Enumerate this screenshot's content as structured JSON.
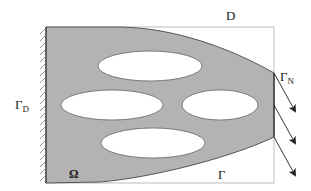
{
  "diagram": {
    "colors": {
      "material_fill": "#b3b3b3",
      "material_edge": "#555555",
      "box_stroke": "#bdbdbd",
      "hatch": "#777777",
      "arrow": "#222222",
      "hole_fill": "#ffffff"
    },
    "labels": {
      "design_domain": "D",
      "neumann_boundary": {
        "symbol": "Γ",
        "subscript": "N"
      },
      "dirichlet_boundary": {
        "symbol": "Γ",
        "subscript": "D"
      },
      "domain": "Ω",
      "free_boundary": "Γ"
    },
    "holes": [
      {
        "name": "top-hole",
        "cx": 150,
        "cy": 66,
        "rx": 52,
        "ry": 15
      },
      {
        "name": "middle-left-hole",
        "cx": 112,
        "cy": 105,
        "rx": 51,
        "ry": 15
      },
      {
        "name": "middle-right-hole",
        "cx": 220,
        "cy": 105,
        "rx": 38,
        "ry": 15
      },
      {
        "name": "bottom-hole",
        "cx": 153,
        "cy": 143,
        "rx": 52,
        "ry": 15
      }
    ],
    "load_arrows": 3,
    "icons": {
      "fixed_support": "hatched-wall-icon",
      "load": "arrow-icon"
    }
  }
}
